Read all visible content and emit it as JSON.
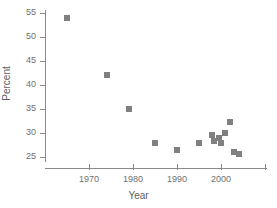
{
  "chart_data": {
    "type": "scatter",
    "title": "",
    "xlabel": "Year",
    "ylabel": "Percent",
    "xlim": [
      1962,
      2013
    ],
    "ylim": [
      22,
      56.5
    ],
    "grid": false,
    "legend": null,
    "marker": {
      "shape": "square",
      "color": "#808080",
      "size_px": 6
    },
    "xticks": [
      {
        "value": 1970,
        "label": "1970"
      },
      {
        "value": 1980,
        "label": "1980"
      },
      {
        "value": 1990,
        "label": "1990"
      },
      {
        "value": 2000,
        "label": "2000"
      },
      {
        "value": 2010,
        "label": ""
      }
    ],
    "yticks": [
      {
        "value": 25,
        "label": "25"
      },
      {
        "value": 30,
        "label": "30"
      },
      {
        "value": 35,
        "label": "35"
      },
      {
        "value": 40,
        "label": "40"
      },
      {
        "value": 45,
        "label": "45"
      },
      {
        "value": 50,
        "label": "50"
      },
      {
        "value": 55,
        "label": "55"
      }
    ],
    "x": [
      1965,
      1974,
      1979,
      1985,
      1990,
      1995,
      1998,
      1998.5,
      1999.5,
      2000,
      2001,
      2002,
      2003,
      2004
    ],
    "y": [
      54,
      42,
      35,
      28,
      26.5,
      28,
      29.5,
      28.3,
      29,
      28,
      30,
      32.2,
      26,
      25.6
    ],
    "points": [
      {
        "x": 1965,
        "y": 54
      },
      {
        "x": 1974,
        "y": 42
      },
      {
        "x": 1979,
        "y": 35
      },
      {
        "x": 1985,
        "y": 28
      },
      {
        "x": 1990,
        "y": 26.5
      },
      {
        "x": 1995,
        "y": 28
      },
      {
        "x": 1998,
        "y": 29.5
      },
      {
        "x": 1998.5,
        "y": 28.3
      },
      {
        "x": 1999.5,
        "y": 29
      },
      {
        "x": 2000,
        "y": 28
      },
      {
        "x": 2001,
        "y": 30
      },
      {
        "x": 2002,
        "y": 32.2
      },
      {
        "x": 2003,
        "y": 26
      },
      {
        "x": 2004,
        "y": 25.6
      }
    ]
  },
  "axes": {
    "x_title": "Year",
    "y_title": "Percent"
  },
  "colors": {
    "marker": "#808080",
    "axis": "#8a8a8a",
    "tick_text": "#6e6e6e",
    "title_text": "#5e5e5e",
    "background": "#ffffff"
  }
}
